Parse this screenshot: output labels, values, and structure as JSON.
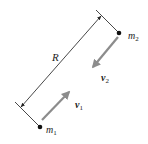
{
  "diagram": {
    "type": "two-body relative motion",
    "separation_label": "R",
    "bodies": [
      {
        "name": "m",
        "subscript": "1",
        "velocity_label": "v",
        "velocity_subscript": "1"
      },
      {
        "name": "m",
        "subscript": "2",
        "velocity_label": "v",
        "velocity_subscript": "2"
      }
    ],
    "colors": {
      "line": "#333333",
      "mass_dot": "#111111",
      "velocity_arrow": "#8c8c8c",
      "text": "#222222"
    }
  }
}
